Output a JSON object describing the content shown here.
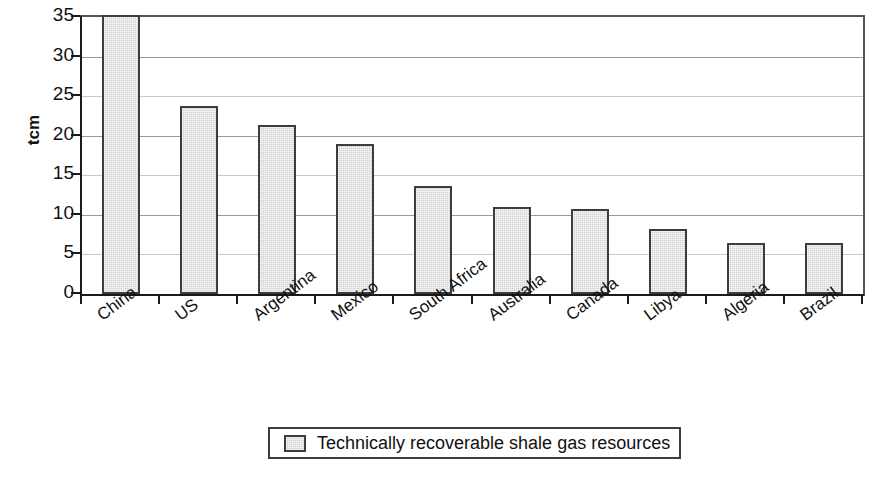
{
  "chart_data": {
    "type": "bar",
    "title": "",
    "xlabel": "",
    "ylabel": "tcm",
    "ylim": [
      0,
      35
    ],
    "yticks": [
      0,
      5,
      10,
      15,
      20,
      25,
      30,
      35
    ],
    "grid": true,
    "legend_position": "bottom",
    "categories": [
      "China",
      "US",
      "Argentina",
      "Mexico",
      "South Africa",
      "Australia",
      "Canada",
      "Libya",
      "Algeria",
      "Brazil"
    ],
    "series": [
      {
        "name": "Technically recoverable shale gas resources",
        "color": "#d2d2d2",
        "values": [
          35.2,
          23.8,
          21.4,
          18.9,
          13.6,
          11.0,
          10.8,
          8.2,
          6.5,
          6.4
        ]
      }
    ]
  },
  "legend": {
    "entries": [
      {
        "label": "Technically recoverable shale gas resources"
      }
    ]
  }
}
